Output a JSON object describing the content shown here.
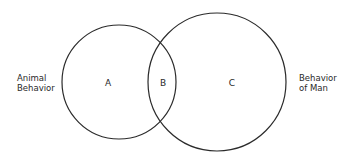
{
  "diagram": {
    "type": "venn",
    "stroke_color": "#2b2b2b",
    "circles": [
      {
        "id": "left",
        "cx": 119,
        "cy": 82,
        "r": 57,
        "label_lines": [
          "Animal",
          "Behavior"
        ]
      },
      {
        "id": "right",
        "cx": 217,
        "cy": 82,
        "r": 69,
        "label_lines": [
          "Behavior",
          "of Man"
        ]
      }
    ],
    "regions": [
      {
        "id": "A",
        "label": "A",
        "x": 108,
        "y": 83
      },
      {
        "id": "B",
        "label": "B",
        "x": 163,
        "y": 83
      },
      {
        "id": "C",
        "label": "C",
        "x": 232,
        "y": 83
      }
    ]
  }
}
